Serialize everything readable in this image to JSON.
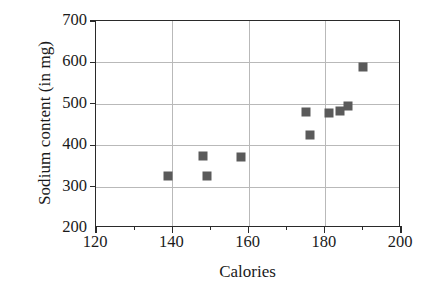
{
  "chart_data": {
    "type": "scatter",
    "title": "",
    "xlabel": "Calories",
    "ylabel": "Sodium content (in mg)",
    "xlim": [
      120,
      200
    ],
    "ylim": [
      200,
      700
    ],
    "xticks": [
      120,
      140,
      160,
      180,
      200
    ],
    "xticks_minor": [
      130,
      150,
      170,
      190
    ],
    "yticks": [
      200,
      300,
      400,
      500,
      600,
      700
    ],
    "grid": "both",
    "legend": "none",
    "marker_color": "#5a5a5a",
    "marker_shape": "square",
    "points": [
      {
        "x": 139,
        "y": 325
      },
      {
        "x": 148,
        "y": 375
      },
      {
        "x": 149,
        "y": 325
      },
      {
        "x": 158,
        "y": 372
      },
      {
        "x": 175,
        "y": 480
      },
      {
        "x": 176,
        "y": 425
      },
      {
        "x": 181,
        "y": 478
      },
      {
        "x": 184,
        "y": 483
      },
      {
        "x": 186,
        "y": 495
      },
      {
        "x": 190,
        "y": 588
      }
    ]
  },
  "axis": {
    "x_tick_labels": [
      "120",
      "140",
      "160",
      "180",
      "200"
    ],
    "y_tick_labels": [
      "200",
      "300",
      "400",
      "500",
      "600",
      "700"
    ]
  }
}
